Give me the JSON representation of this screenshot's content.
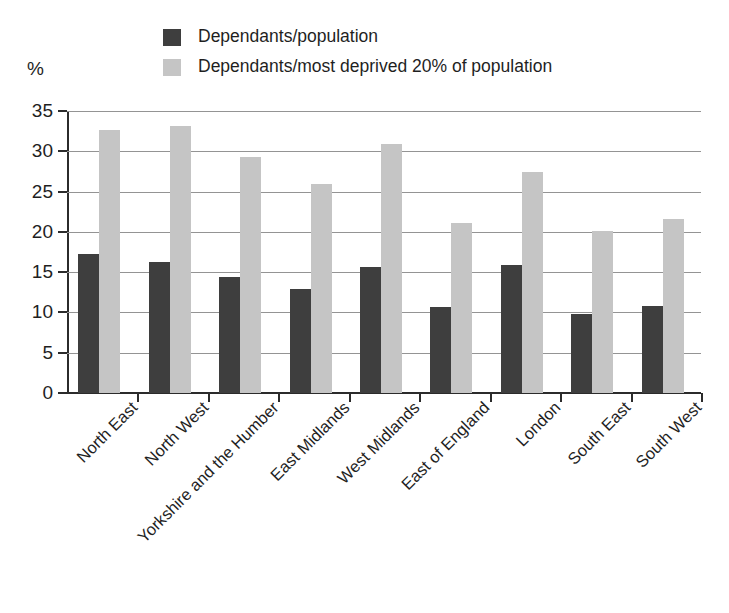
{
  "chart_data": {
    "type": "bar",
    "title": "",
    "subtitle": "",
    "xlabel": "",
    "ylabel": "%",
    "ylim": [
      0,
      35
    ],
    "ytick_step": 5,
    "yticks": [
      "0",
      "5",
      "10",
      "15",
      "20",
      "25",
      "30",
      "35"
    ],
    "grid": true,
    "legend_position": "top-left",
    "orientation": "vertical",
    "grouping": "grouped",
    "categories": [
      "North East",
      "North West",
      "Yorkshire and the Humber",
      "East Midlands",
      "West Midlands",
      "East of England",
      "London",
      "South East",
      "South West"
    ],
    "series": [
      {
        "name": "Dependants/population",
        "color": "#3e3e3e",
        "values": [
          17.3,
          16.2,
          14.4,
          12.9,
          15.7,
          10.7,
          15.9,
          9.8,
          10.8
        ]
      },
      {
        "name": "Dependants/most deprived 20% of population",
        "color": "#c5c5c5",
        "values": [
          32.7,
          33.2,
          29.3,
          26.0,
          30.9,
          21.1,
          27.4,
          20.1,
          21.6
        ]
      }
    ],
    "annotations": []
  },
  "legend": {
    "items": [
      {
        "label": "Dependants/population",
        "color": "#3e3e3e"
      },
      {
        "label": "Dependants/most deprived 20% of population",
        "color": "#c5c5c5"
      }
    ]
  },
  "axis": {
    "unit_label": "%"
  },
  "colors": {
    "series_dark": "#3e3e3e",
    "series_light": "#c5c5c5",
    "axis": "#2b2b2b",
    "gridline": "#949494",
    "background": "#ffffff",
    "text": "#1f1f1f"
  }
}
